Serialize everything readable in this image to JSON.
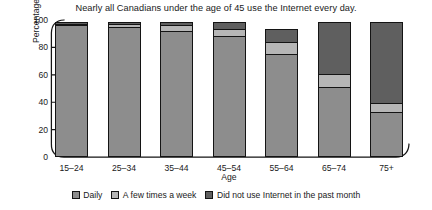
{
  "chart_data": {
    "type": "bar",
    "subtype": "stacked-bar",
    "title": "Nearly all Canadians under the age of 45 use the Internet every day.",
    "xlabel": "Age",
    "ylabel": "Percentage",
    "ylim": [
      0,
      100
    ],
    "yticks": [
      100,
      80,
      60,
      40,
      20,
      0
    ],
    "grid": false,
    "legend_position": "bottom",
    "categories": [
      "15–24",
      "25–34",
      "35–44",
      "45–54",
      "55–64",
      "65–74",
      "75+"
    ],
    "series": [
      {
        "name": "Daily",
        "color": "#8d8d8d",
        "values": [
          96,
          95,
          92,
          88,
          75,
          51,
          33
        ]
      },
      {
        "name": "A few times a week",
        "color": "#b6b6b6",
        "values": [
          2,
          3,
          5,
          6,
          10,
          10,
          7
        ]
      },
      {
        "name": "Did not use Internet in the past month",
        "color": "#5f5f5f",
        "values": [
          2,
          2,
          3,
          6,
          10,
          39,
          60
        ]
      }
    ],
    "stack_order_bottom_to_top": [
      "Daily",
      "A few times a week",
      "Did not use Internet in the past month"
    ]
  },
  "legend": {
    "items": [
      {
        "label": "Daily"
      },
      {
        "label": "A few times a week"
      },
      {
        "label": "Did not use Internet in the past month"
      }
    ]
  }
}
